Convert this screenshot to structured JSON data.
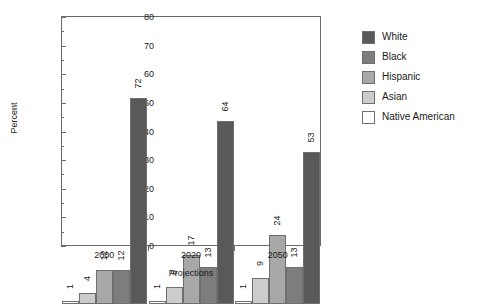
{
  "chart_data": {
    "type": "bar",
    "title": "",
    "xlabel": "Projections",
    "ylabel": "Percent",
    "categories": [
      "2000",
      "2020",
      "2050"
    ],
    "ylim": [
      0,
      80
    ],
    "yticks": [
      0,
      10,
      20,
      30,
      40,
      50,
      60,
      70,
      80
    ],
    "yminorticks": [
      5,
      15,
      25,
      35,
      45,
      55,
      65,
      75
    ],
    "grid": false,
    "legend_position": "right",
    "series": [
      {
        "name": "White",
        "color": "#595959",
        "values": [
          72,
          64,
          53
        ]
      },
      {
        "name": "Black",
        "color": "#7d7d7d",
        "values": [
          12,
          13,
          13
        ]
      },
      {
        "name": "Hispanic",
        "color": "#a8a8a8",
        "values": [
          12,
          17,
          24
        ]
      },
      {
        "name": "Asian",
        "color": "#cccccc",
        "values": [
          4,
          6,
          9
        ]
      },
      {
        "name": "Native American",
        "color": "#ffffff",
        "values": [
          1,
          1,
          1
        ]
      }
    ],
    "bar_draw_order": [
      "Native American",
      "Asian",
      "Hispanic",
      "Black",
      "White"
    ],
    "value_label_rotation": "vertical"
  }
}
